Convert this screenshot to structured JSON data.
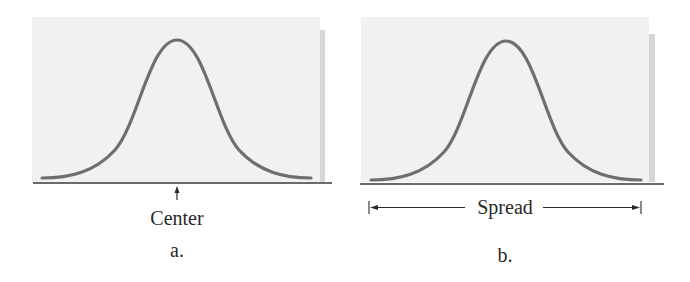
{
  "figure": {
    "panels": [
      {
        "id": "a",
        "caption": "a.",
        "annotation": "Center",
        "annotation_type": "point-arrow",
        "curve": "normal-distribution"
      },
      {
        "id": "b",
        "caption": "b.",
        "annotation": "Spread",
        "annotation_type": "double-headed-span-arrow",
        "curve": "normal-distribution"
      }
    ],
    "colors": {
      "panel_background": "#f1f1f1",
      "panel_shadow": "#d6d6d6",
      "curve": "#6e6e6e",
      "baseline": "#3a3a3a",
      "text": "#2a2a2a"
    }
  }
}
